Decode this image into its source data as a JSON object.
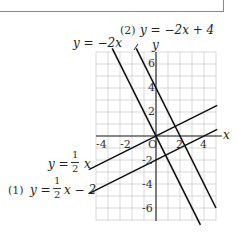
{
  "diagram": {
    "type": "coordinate-graph",
    "axes": {
      "x_label": "x",
      "y_label": "y",
      "origin_label": "O",
      "x_ticks": [
        "-4",
        "-2",
        "2",
        "4"
      ],
      "y_ticks": [
        "6",
        "4",
        "2",
        "-2",
        "-4",
        "-6"
      ],
      "xlim": [
        -5,
        5
      ],
      "ylim": [
        -7,
        7
      ],
      "grid_step": 1
    },
    "lines": [
      {
        "id": "l1",
        "label": "y = -2x",
        "slope": -2,
        "intercept": 0
      },
      {
        "id": "l2",
        "marker": "(2)",
        "label": "y = -2x + 4",
        "slope": -2,
        "intercept": 4
      },
      {
        "id": "l3",
        "label": "y = 1/2 x",
        "slope": 0.5,
        "intercept": 0
      },
      {
        "id": "l4",
        "marker": "(1)",
        "label": "y = 1/2 x - 2",
        "slope": 0.5,
        "intercept": -2
      }
    ],
    "labels": {
      "l1": "y = −2x",
      "l2_marker": "(2)",
      "l2": "y = −2x + 4",
      "l3_a": "y =",
      "l3_num": "1",
      "l3_den": "2",
      "l3_b": "x",
      "l4_marker": "(1)",
      "l4_a": "y =",
      "l4_num": "1",
      "l4_den": "2",
      "l4_b": "x − 2"
    }
  }
}
